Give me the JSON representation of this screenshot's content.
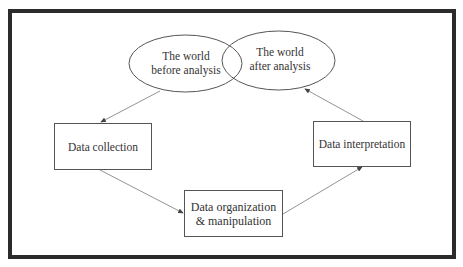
{
  "diagram": {
    "nodes": [
      {
        "id": "world_before",
        "shape": "ellipse",
        "label_line1": "The world",
        "label_line2": "before analysis"
      },
      {
        "id": "world_after",
        "shape": "ellipse",
        "label_line1": "The world",
        "label_line2": "after analysis"
      },
      {
        "id": "collection",
        "shape": "rect",
        "label": "Data collection"
      },
      {
        "id": "organization",
        "shape": "rect",
        "label_line1": "Data organization",
        "label_line2": "& manipulation"
      },
      {
        "id": "interpretation",
        "shape": "rect",
        "label": "Data interpretation"
      }
    ],
    "edges": [
      {
        "from": "world_before",
        "to": "collection"
      },
      {
        "from": "collection",
        "to": "organization"
      },
      {
        "from": "organization",
        "to": "interpretation"
      },
      {
        "from": "interpretation",
        "to": "world_after"
      }
    ],
    "colors": {
      "frame": "#2b2b2b",
      "stroke": "#555555",
      "text": "#333333"
    }
  }
}
